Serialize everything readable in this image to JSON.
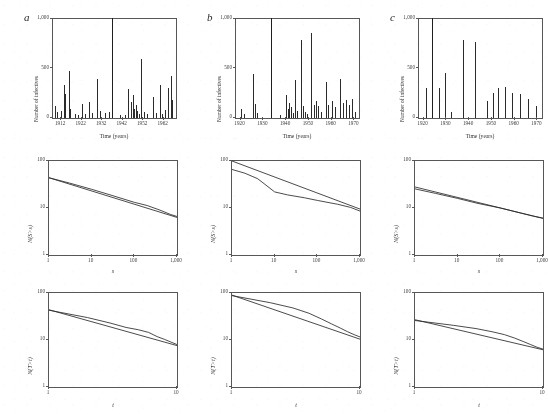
{
  "figure": {
    "panels": [
      "a",
      "b",
      "c"
    ],
    "columns": [
      {
        "letter": "a"
      },
      {
        "letter": "b"
      },
      {
        "letter": "c"
      }
    ]
  },
  "timeseries": {
    "ylabel": "Number of infectives",
    "xlabel": "Time (years)",
    "yticks": [
      "0",
      "500",
      "1,000"
    ],
    "ylim": [
      0,
      1000
    ],
    "panels": [
      {
        "letter": "a",
        "xticks": [
          "1912",
          "1922",
          "1932",
          "1942",
          "1952",
          "1962"
        ],
        "xlim": [
          1908,
          1968
        ],
        "peaks": [
          {
            "year": 1909.0,
            "value": 120
          },
          {
            "year": 1909.8,
            "value": 60
          },
          {
            "year": 1912.1,
            "value": 70
          },
          {
            "year": 1913.2,
            "value": 330
          },
          {
            "year": 1914.0,
            "value": 240
          },
          {
            "year": 1915.6,
            "value": 470
          },
          {
            "year": 1916.4,
            "value": 95
          },
          {
            "year": 1918.8,
            "value": 40
          },
          {
            "year": 1920.2,
            "value": 30
          },
          {
            "year": 1921.9,
            "value": 140
          },
          {
            "year": 1923.4,
            "value": 45
          },
          {
            "year": 1925.7,
            "value": 160
          },
          {
            "year": 1927.1,
            "value": 55
          },
          {
            "year": 1929.6,
            "value": 390
          },
          {
            "year": 1930.8,
            "value": 75
          },
          {
            "year": 1933.4,
            "value": 50
          },
          {
            "year": 1935.1,
            "value": 60
          },
          {
            "year": 1937.0,
            "value": 1000
          },
          {
            "year": 1940.6,
            "value": 35
          },
          {
            "year": 1942.9,
            "value": 30
          },
          {
            "year": 1944.8,
            "value": 290
          },
          {
            "year": 1945.9,
            "value": 160
          },
          {
            "year": 1946.8,
            "value": 230
          },
          {
            "year": 1947.6,
            "value": 95
          },
          {
            "year": 1948.4,
            "value": 130
          },
          {
            "year": 1949.1,
            "value": 70
          },
          {
            "year": 1949.9,
            "value": 45
          },
          {
            "year": 1951.0,
            "value": 600
          },
          {
            "year": 1952.3,
            "value": 60
          },
          {
            "year": 1954.0,
            "value": 40
          },
          {
            "year": 1956.6,
            "value": 210
          },
          {
            "year": 1958.0,
            "value": 55
          },
          {
            "year": 1960.3,
            "value": 330
          },
          {
            "year": 1961.2,
            "value": 45
          },
          {
            "year": 1962.6,
            "value": 80
          },
          {
            "year": 1964.1,
            "value": 300
          },
          {
            "year": 1965.4,
            "value": 420
          },
          {
            "year": 1966.2,
            "value": 180
          }
        ]
      },
      {
        "letter": "b",
        "xticks": [
          "1920",
          "1930",
          "1940",
          "1950",
          "1960",
          "1970"
        ],
        "xlim": [
          1918,
          1972
        ],
        "peaks": [
          {
            "year": 1920.4,
            "value": 90
          },
          {
            "year": 1921.6,
            "value": 40
          },
          {
            "year": 1925.6,
            "value": 440
          },
          {
            "year": 1926.4,
            "value": 140
          },
          {
            "year": 1927.0,
            "value": 55
          },
          {
            "year": 1933.5,
            "value": 1000
          },
          {
            "year": 1937.5,
            "value": 35
          },
          {
            "year": 1939.8,
            "value": 230
          },
          {
            "year": 1940.7,
            "value": 90
          },
          {
            "year": 1941.4,
            "value": 150
          },
          {
            "year": 1942.2,
            "value": 110
          },
          {
            "year": 1943.0,
            "value": 55
          },
          {
            "year": 1944.0,
            "value": 380
          },
          {
            "year": 1944.9,
            "value": 70
          },
          {
            "year": 1946.5,
            "value": 790
          },
          {
            "year": 1947.6,
            "value": 120
          },
          {
            "year": 1948.4,
            "value": 60
          },
          {
            "year": 1949.3,
            "value": 45
          },
          {
            "year": 1950.8,
            "value": 860
          },
          {
            "year": 1952.1,
            "value": 130
          },
          {
            "year": 1953.0,
            "value": 170
          },
          {
            "year": 1954.2,
            "value": 120
          },
          {
            "year": 1955.3,
            "value": 60
          },
          {
            "year": 1957.4,
            "value": 360
          },
          {
            "year": 1958.6,
            "value": 130
          },
          {
            "year": 1960.2,
            "value": 170
          },
          {
            "year": 1961.5,
            "value": 110
          },
          {
            "year": 1963.6,
            "value": 390
          },
          {
            "year": 1965.0,
            "value": 150
          },
          {
            "year": 1966.4,
            "value": 180
          },
          {
            "year": 1967.7,
            "value": 130
          },
          {
            "year": 1969.0,
            "value": 190
          },
          {
            "year": 1970.2,
            "value": 60
          }
        ]
      },
      {
        "letter": "c",
        "xticks": [
          "1920",
          "1930",
          "1940",
          "1950",
          "1960",
          "1970"
        ],
        "xlim": [
          1918,
          1972
        ],
        "peaks": [
          {
            "year": 1921.0,
            "value": 300
          },
          {
            "year": 1923.6,
            "value": 1000
          },
          {
            "year": 1926.6,
            "value": 300
          },
          {
            "year": 1929.2,
            "value": 450
          },
          {
            "year": 1932.0,
            "value": 60
          },
          {
            "year": 1937.2,
            "value": 790
          },
          {
            "year": 1942.8,
            "value": 770
          },
          {
            "year": 1947.8,
            "value": 170
          },
          {
            "year": 1950.5,
            "value": 250
          },
          {
            "year": 1952.8,
            "value": 300
          },
          {
            "year": 1955.8,
            "value": 310
          },
          {
            "year": 1959.0,
            "value": 250
          },
          {
            "year": 1962.4,
            "value": 240
          },
          {
            "year": 1965.8,
            "value": 190
          },
          {
            "year": 1969.2,
            "value": 120
          }
        ]
      }
    ]
  },
  "size_distribution": {
    "ylabel": "N(S>s)",
    "xlabel": "s",
    "xticks": [
      "1",
      "10",
      "100",
      "1,000"
    ],
    "yticks": [
      "1",
      "10",
      "100"
    ],
    "xlim": [
      1,
      1000
    ],
    "ylim": [
      1,
      100
    ],
    "panels": [
      {
        "letter": "a",
        "fit": {
          "x": [
            1,
            1000
          ],
          "y": [
            44,
            6.3
          ]
        },
        "data_x": [
          1,
          3,
          10,
          30,
          100,
          200,
          400,
          700,
          1000
        ],
        "data_y": [
          44,
          34,
          25,
          18.5,
          13.2,
          11.3,
          9.0,
          7.3,
          6.6
        ]
      },
      {
        "letter": "b",
        "fit": {
          "x": [
            1,
            1000
          ],
          "y": [
            100,
            9.5
          ]
        },
        "data_x": [
          1,
          2,
          4,
          10,
          20,
          50,
          100,
          300,
          600,
          1000
        ],
        "data_y": [
          66,
          55,
          42,
          22,
          19,
          16.5,
          14.5,
          12.0,
          10.3,
          8.6
        ]
      },
      {
        "letter": "c",
        "fit": {
          "x": [
            1,
            1000
          ],
          "y": [
            28,
            6.0
          ]
        },
        "data_x": [
          1,
          3,
          10,
          30,
          100,
          300,
          600,
          1000
        ],
        "data_y": [
          25.5,
          20.5,
          16.0,
          12.5,
          10.0,
          7.8,
          6.7,
          6.1
        ]
      }
    ]
  },
  "duration_distribution": {
    "ylabel": "N(T>t)",
    "xlabel": "t",
    "xticks": [
      "1",
      "10"
    ],
    "yticks": [
      "1",
      "10",
      "100"
    ],
    "xlim": [
      1,
      10
    ],
    "ylim": [
      1,
      100
    ],
    "panels": [
      {
        "letter": "a",
        "fit": {
          "x": [
            1,
            10
          ],
          "y": [
            44,
            7.6
          ]
        },
        "data_x": [
          1,
          2,
          3,
          4,
          5,
          6,
          7,
          8,
          9,
          10
        ],
        "data_y": [
          43,
          30,
          23,
          18.5,
          16.5,
          14.5,
          11.8,
          10.3,
          9.0,
          8.0
        ]
      },
      {
        "letter": "b",
        "fit": {
          "x": [
            1,
            10
          ],
          "y": [
            90,
            10.4
          ]
        },
        "data_x": [
          1,
          2,
          3,
          4,
          5,
          6,
          7,
          8,
          9,
          10
        ],
        "data_y": [
          88,
          62,
          48,
          37,
          28,
          22,
          18,
          15,
          13,
          11.6
        ]
      },
      {
        "letter": "c",
        "fit": {
          "x": [
            1,
            10
          ],
          "y": [
            27,
            6.2
          ]
        },
        "data_x": [
          1,
          2,
          3,
          4,
          5,
          6,
          7,
          8,
          9,
          10
        ],
        "data_y": [
          26,
          20.5,
          17.5,
          15.0,
          13.0,
          11.0,
          9.3,
          8.0,
          7.0,
          6.4
        ]
      }
    ]
  }
}
